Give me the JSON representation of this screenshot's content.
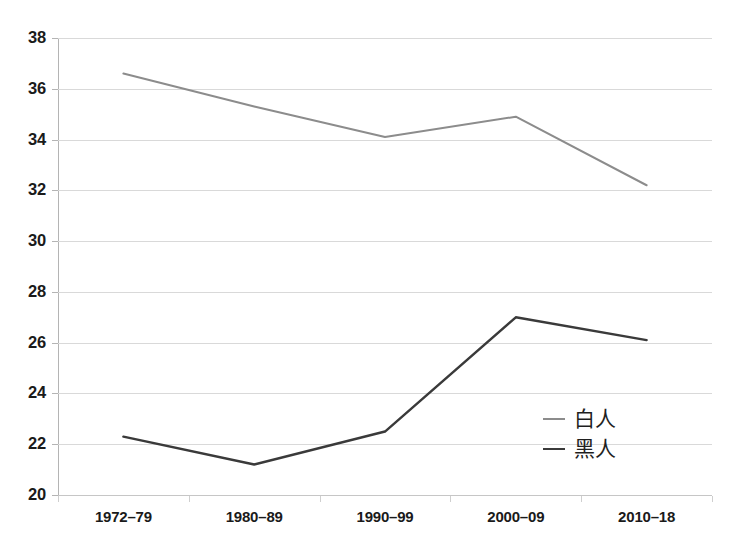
{
  "chart_data": {
    "type": "line",
    "title": "",
    "subtitle": "",
    "xlabel": "",
    "ylabel": "",
    "categories": [
      "1972–79",
      "1980–89",
      "1990–99",
      "2000–09",
      "2010–18"
    ],
    "ylim": [
      20,
      38
    ],
    "ytick_step": 2,
    "yticks": [
      "38",
      "36",
      "34",
      "32",
      "30",
      "28",
      "26",
      "24",
      "22",
      "20"
    ],
    "ytick_values": [
      38,
      36,
      34,
      32,
      30,
      28,
      26,
      24,
      22,
      20
    ],
    "grid": true,
    "grid_axis": "y",
    "legend_position": "inside-right-lower",
    "series": [
      {
        "name": "白人",
        "color": "#8c8c8c",
        "line_width": 2,
        "values": [
          36.6,
          35.3,
          34.1,
          34.9,
          32.2
        ]
      },
      {
        "name": "黑人",
        "color": "#3a3a3a",
        "line_width": 2.4,
        "values": [
          22.3,
          21.2,
          22.5,
          27.0,
          26.1
        ]
      }
    ]
  },
  "legend": {
    "items": [
      {
        "label": "白人",
        "color": "#8c8c8c"
      },
      {
        "label": "黑人",
        "color": "#3a3a3a"
      }
    ]
  },
  "colors": {
    "background": "#ffffff",
    "gridline": "#d9d9d9",
    "axis": "#b4b4b4",
    "tick_text": "#1a1a1a",
    "series_white": "#8c8c8c",
    "series_black": "#3a3a3a"
  }
}
